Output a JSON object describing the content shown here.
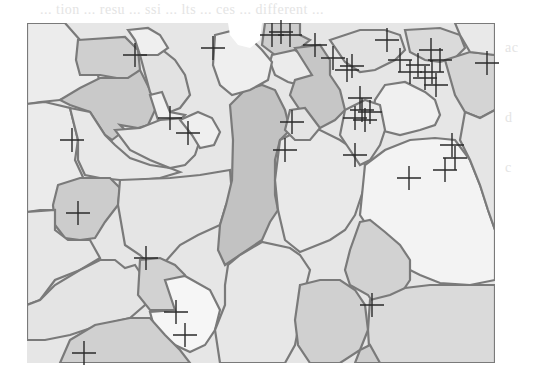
{
  "figure": {
    "bleed_text": {
      "top": "... tion ... resu ... ssi ... lts ... ces ... different ...",
      "right_lines": [
        "ac",
        "d",
        "c",
        "ic",
        "n",
        "e"
      ],
      "left_lines": [
        "",
        "",
        ""
      ]
    },
    "map": {
      "x": 27,
      "y": 23,
      "width": 468,
      "height": 340
    },
    "colors": {
      "background": "#ffffff",
      "light": "#ececec",
      "mid_light": "#e0e0e0",
      "mid": "#d2d2d2",
      "dark": "#bdbdbd",
      "white_region": "#f7f7f7",
      "boundary": "#7a7a7a",
      "cross": "#2a2a2a"
    },
    "crosses": [
      [
        135,
        55
      ],
      [
        213,
        48
      ],
      [
        281,
        32
      ],
      [
        272,
        35
      ],
      [
        290,
        35
      ],
      [
        315,
        45
      ],
      [
        333,
        58
      ],
      [
        347,
        70
      ],
      [
        387,
        40
      ],
      [
        400,
        60
      ],
      [
        410,
        72
      ],
      [
        418,
        65
      ],
      [
        425,
        78
      ],
      [
        431,
        50
      ],
      [
        432,
        72
      ],
      [
        436,
        85
      ],
      [
        440,
        60
      ],
      [
        487,
        63
      ],
      [
        72,
        140
      ],
      [
        170,
        118
      ],
      [
        188,
        133
      ],
      [
        292,
        122
      ],
      [
        285,
        150
      ],
      [
        352,
        66
      ],
      [
        360,
        98
      ],
      [
        362,
        110
      ],
      [
        355,
        118
      ],
      [
        365,
        120
      ],
      [
        370,
        112
      ],
      [
        355,
        155
      ],
      [
        452,
        145
      ],
      [
        455,
        158
      ],
      [
        445,
        170
      ],
      [
        409,
        178
      ],
      [
        78,
        213
      ],
      [
        146,
        258
      ],
      [
        176,
        312
      ],
      [
        185,
        335
      ],
      [
        84,
        353
      ],
      [
        372,
        305
      ]
    ]
  }
}
